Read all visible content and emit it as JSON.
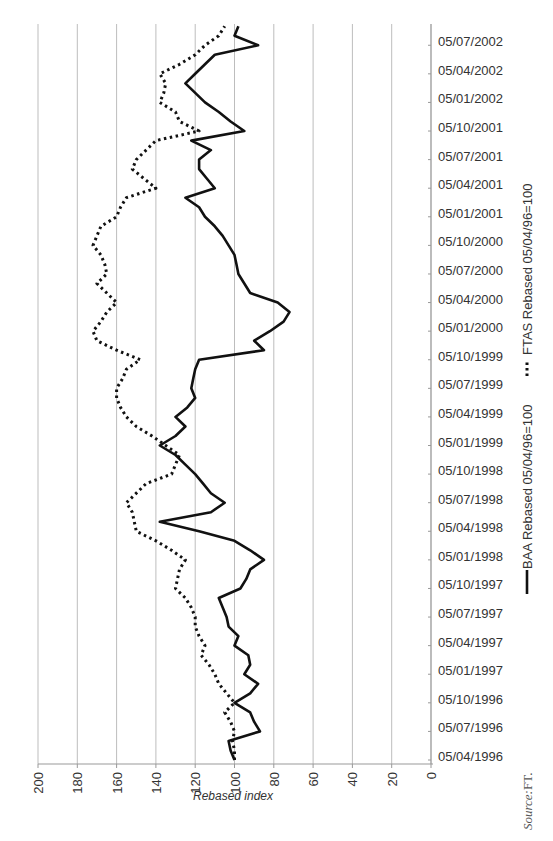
{
  "chart_data": {
    "type": "line",
    "orientation": "rotated-90-ccw",
    "title": "",
    "xlabel": "",
    "ylabel": "Rebased index",
    "ylim": [
      0,
      200
    ],
    "yticks": [
      0,
      20,
      40,
      60,
      80,
      100,
      120,
      140,
      160,
      180,
      200
    ],
    "grid": true,
    "legend_position": "right",
    "x_tick_labels": [
      "05/04/1996",
      "05/07/1996",
      "05/10/1996",
      "05/01/1997",
      "05/04/1997",
      "05/07/1997",
      "05/10/1997",
      "05/01/1998",
      "05/04/1998",
      "05/07/1998",
      "05/10/1998",
      "05/01/1999",
      "05/04/1999",
      "05/07/1999",
      "05/10/1999",
      "05/01/2000",
      "05/04/2000",
      "05/07/2000",
      "05/10/2000",
      "05/01/2001",
      "05/04/2001",
      "05/07/2001",
      "05/10/2001",
      "05/01/2002",
      "05/04/2002",
      "05/07/2002"
    ],
    "x_unit": "months since 05/04/1996",
    "series": [
      {
        "name": "BAA Rebased 05/04/96=100",
        "style": "solid",
        "color": "#111111",
        "points": [
          [
            0,
            100
          ],
          [
            1,
            102
          ],
          [
            2,
            103
          ],
          [
            3,
            87
          ],
          [
            4,
            90
          ],
          [
            5,
            92
          ],
          [
            6,
            100
          ],
          [
            7,
            92
          ],
          [
            8,
            88
          ],
          [
            9,
            95
          ],
          [
            10,
            92
          ],
          [
            11,
            93
          ],
          [
            12,
            100
          ],
          [
            13,
            98
          ],
          [
            14,
            103
          ],
          [
            15,
            104
          ],
          [
            16,
            106
          ],
          [
            17,
            108
          ],
          [
            18,
            97
          ],
          [
            19,
            94
          ],
          [
            20,
            92
          ],
          [
            21,
            85
          ],
          [
            22,
            92
          ],
          [
            23,
            100
          ],
          [
            24,
            118
          ],
          [
            25,
            138
          ],
          [
            26,
            112
          ],
          [
            27,
            105
          ],
          [
            28,
            112
          ],
          [
            29,
            116
          ],
          [
            30,
            120
          ],
          [
            31,
            125
          ],
          [
            32,
            130
          ],
          [
            33,
            138
          ],
          [
            34,
            130
          ],
          [
            35,
            125
          ],
          [
            36,
            130
          ],
          [
            37,
            124
          ],
          [
            38,
            120
          ],
          [
            39,
            122
          ],
          [
            40,
            121
          ],
          [
            41,
            120
          ],
          [
            42,
            118
          ],
          [
            43,
            85
          ],
          [
            44,
            90
          ],
          [
            45,
            82
          ],
          [
            46,
            75
          ],
          [
            47,
            72
          ],
          [
            48,
            78
          ],
          [
            49,
            92
          ],
          [
            50,
            95
          ],
          [
            51,
            98
          ],
          [
            52,
            99
          ],
          [
            53,
            100
          ],
          [
            54,
            103
          ],
          [
            55,
            106
          ],
          [
            56,
            110
          ],
          [
            57,
            115
          ],
          [
            58,
            118
          ],
          [
            59,
            125
          ],
          [
            60,
            110
          ],
          [
            61,
            114
          ],
          [
            62,
            118
          ],
          [
            63,
            118
          ],
          [
            64,
            112
          ],
          [
            65,
            122
          ],
          [
            66,
            95
          ],
          [
            67,
            102
          ],
          [
            68,
            108
          ],
          [
            69,
            115
          ],
          [
            70,
            120
          ],
          [
            71,
            125
          ],
          [
            72,
            120
          ],
          [
            73,
            115
          ],
          [
            74,
            110
          ],
          [
            75,
            88
          ],
          [
            76,
            100
          ],
          [
            77,
            98
          ]
        ]
      },
      {
        "name": "FTAS Rebased 05/04/96=100",
        "style": "dotted",
        "color": "#111111",
        "points": [
          [
            0,
            100
          ],
          [
            1,
            100
          ],
          [
            2,
            101
          ],
          [
            3,
            100
          ],
          [
            4,
            102
          ],
          [
            5,
            105
          ],
          [
            6,
            100
          ],
          [
            7,
            104
          ],
          [
            8,
            108
          ],
          [
            9,
            110
          ],
          [
            10,
            113
          ],
          [
            11,
            117
          ],
          [
            12,
            115
          ],
          [
            13,
            118
          ],
          [
            14,
            120
          ],
          [
            15,
            120
          ],
          [
            16,
            122
          ],
          [
            17,
            125
          ],
          [
            18,
            130
          ],
          [
            19,
            129
          ],
          [
            20,
            128
          ],
          [
            21,
            125
          ],
          [
            22,
            132
          ],
          [
            23,
            140
          ],
          [
            24,
            150
          ],
          [
            25,
            151
          ],
          [
            26,
            152
          ],
          [
            27,
            155
          ],
          [
            28,
            150
          ],
          [
            29,
            145
          ],
          [
            30,
            132
          ],
          [
            31,
            130
          ],
          [
            32,
            128
          ],
          [
            33,
            135
          ],
          [
            34,
            142
          ],
          [
            35,
            150
          ],
          [
            36,
            155
          ],
          [
            37,
            158
          ],
          [
            38,
            160
          ],
          [
            39,
            160
          ],
          [
            40,
            157
          ],
          [
            41,
            155
          ],
          [
            42,
            148
          ],
          [
            43,
            160
          ],
          [
            44,
            170
          ],
          [
            45,
            172
          ],
          [
            46,
            168
          ],
          [
            47,
            165
          ],
          [
            48,
            160
          ],
          [
            49,
            165
          ],
          [
            50,
            170
          ],
          [
            51,
            165
          ],
          [
            52,
            166
          ],
          [
            53,
            168
          ],
          [
            54,
            172
          ],
          [
            55,
            170
          ],
          [
            56,
            168
          ],
          [
            57,
            160
          ],
          [
            58,
            158
          ],
          [
            59,
            155
          ],
          [
            60,
            140
          ],
          [
            61,
            146
          ],
          [
            62,
            152
          ],
          [
            63,
            150
          ],
          [
            64,
            145
          ],
          [
            65,
            140
          ],
          [
            66,
            118
          ],
          [
            67,
            128
          ],
          [
            68,
            130
          ],
          [
            69,
            138
          ],
          [
            70,
            136
          ],
          [
            71,
            135
          ],
          [
            72,
            138
          ],
          [
            73,
            128
          ],
          [
            74,
            120
          ],
          [
            75,
            115
          ],
          [
            76,
            108
          ],
          [
            77,
            105
          ]
        ]
      }
    ],
    "annotations": [
      "Source: FT."
    ]
  },
  "axis": {
    "title": "Rebased index"
  },
  "legend": {
    "baa_label": "BAA Rebased 05/04/96=100",
    "ftas_label": "FTAS Rebased 05/04/96=100"
  },
  "source": {
    "label": "Source:",
    "value": "FT."
  }
}
